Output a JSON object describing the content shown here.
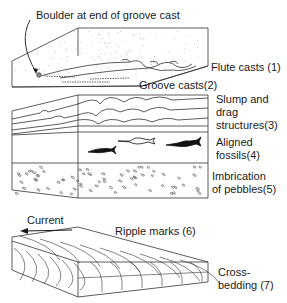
{
  "figure": {
    "panels": [
      {
        "id": "sole-marks",
        "labels": {
          "boulder": "Boulder at end of groove cast",
          "flute": "Flute casts (1)",
          "groove": "Groove casts(2)"
        }
      },
      {
        "id": "internal-structures",
        "labels": {
          "slump_line1": "Slump and",
          "slump_line2": "drag",
          "slump_line3": "structures(3)",
          "fossils_line1": "Aligned",
          "fossils_line2": "fossils(4)",
          "pebbles_line1": "Imbrication",
          "pebbles_line2": "of pebbles(5)"
        }
      },
      {
        "id": "ripple-block",
        "labels": {
          "current": "Current",
          "ripple": "Ripple marks (6)",
          "cross_line1": "Cross-",
          "cross_line2": "bedding (7)"
        }
      }
    ],
    "colors": {
      "ink": "#1a1a1a",
      "stipple": "#8a8a8a",
      "paper": "#ffffff"
    }
  }
}
